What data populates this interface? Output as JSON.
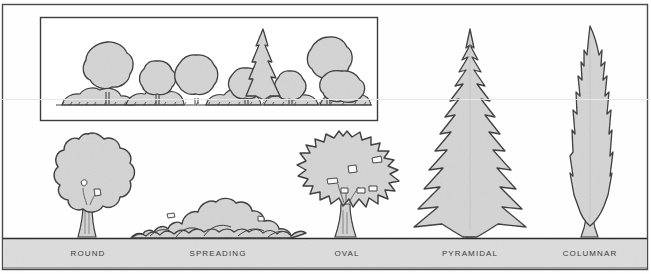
{
  "figure": {
    "caption_row": {
      "labels": [
        {
          "text": "ROUND",
          "x": 88,
          "y": 253
        },
        {
          "text": "SPREADING",
          "x": 218,
          "y": 253
        },
        {
          "text": "OVAL",
          "x": 347,
          "y": 253
        },
        {
          "text": "PYRAMIDAL",
          "x": 470,
          "y": 253
        },
        {
          "text": "COLUMNAR",
          "x": 590,
          "y": 253
        }
      ]
    },
    "colors": {
      "paper": "#fefefe",
      "foliage_fill": "#d4d4d4",
      "ground_band": "#dcdcdc",
      "ink": "#2b2b2b",
      "frame": "#4a4a4a",
      "scanline": "#e8e8e8",
      "label_text": "#3a3a3a"
    },
    "frame": {
      "x": 2,
      "y": 4,
      "w": 646,
      "h": 266
    },
    "inset_box": {
      "x": 40,
      "y": 17,
      "w": 338,
      "h": 104,
      "name": "massing-inset"
    },
    "ground": {
      "line_y": 238,
      "band_top": 239,
      "band_bottom": 268
    },
    "scanline_y": 99,
    "specimens": [
      {
        "name": "round",
        "label": "ROUND",
        "center_x": 88,
        "crown_top": 134,
        "crown_bottom": 228,
        "width": 96,
        "form": "round-canopy"
      },
      {
        "name": "spreading",
        "label": "SPREADING",
        "center_x": 218,
        "crown_top": 197,
        "crown_bottom": 238,
        "width": 175,
        "form": "low-broad-mound"
      },
      {
        "name": "oval",
        "label": "OVAL",
        "center_x": 347,
        "crown_top": 131,
        "crown_bottom": 230,
        "width": 130,
        "form": "broad-spiky-oval"
      },
      {
        "name": "pyramidal",
        "label": "PYRAMIDAL",
        "center_x": 470,
        "crown_top": 29,
        "crown_bottom": 238,
        "width": 112,
        "form": "conifer-triangle"
      },
      {
        "name": "columnar",
        "label": "COLUMNAR",
        "center_x": 590,
        "crown_top": 26,
        "crown_bottom": 236,
        "width": 40,
        "form": "narrow-spire"
      }
    ],
    "inset_elements": [
      {
        "name": "inset-round-tree-1",
        "kind": "round-tree",
        "cx": 107,
        "cy": 68,
        "r": 26
      },
      {
        "name": "inset-round-tree-2",
        "kind": "round-tree",
        "cx": 157,
        "cy": 80,
        "r": 19
      },
      {
        "name": "inset-round-tree-3",
        "kind": "round-tree",
        "cx": 196,
        "cy": 78,
        "r": 23
      },
      {
        "name": "inset-round-tree-4",
        "kind": "round-tree",
        "cx": 246,
        "cy": 86,
        "r": 18
      },
      {
        "name": "inset-conifer",
        "kind": "conifer",
        "cx": 263,
        "cy": 34,
        "r": 20
      },
      {
        "name": "inset-round-tree-5",
        "kind": "round-tree",
        "cx": 290,
        "cy": 87,
        "r": 16
      },
      {
        "name": "inset-round-tree-6",
        "kind": "round-tree",
        "cx": 328,
        "cy": 62,
        "r": 24
      },
      {
        "name": "inset-round-tree-7",
        "kind": "round-tree",
        "cx": 341,
        "cy": 86,
        "r": 19
      },
      {
        "name": "inset-ground-y",
        "kind": "ground",
        "cx": 0,
        "cy": 105,
        "r": 0
      }
    ]
  }
}
